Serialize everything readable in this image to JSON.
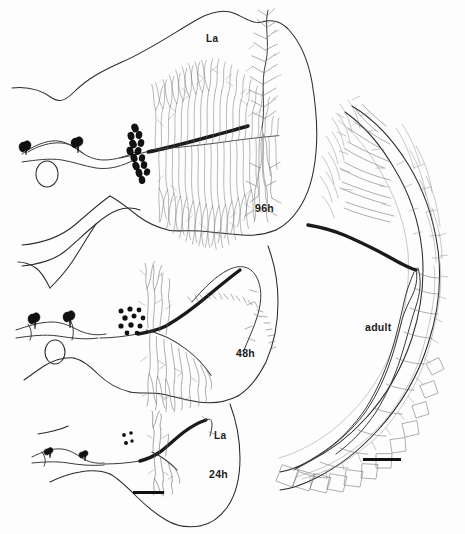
{
  "figure": {
    "background_color": "#fdfdfd",
    "ink_color": "#2b2b2b",
    "dark_ink_color": "#111111",
    "width": 465,
    "height": 534
  },
  "panels": [
    {
      "id": "panel-96h",
      "stage_label": "96h",
      "region_label": "La",
      "stage_label_pos": {
        "x": 255,
        "y": 202
      },
      "region_label_pos": {
        "x": 206,
        "y": 38
      },
      "description": "Dense terminal arborization with numerous dark boutons along proximal axon and two teardrop somata",
      "bouton_count": 14,
      "soma_count": 2
    },
    {
      "id": "panel-48h",
      "stage_label": "48h",
      "region_label": "",
      "stage_label_pos": {
        "x": 236,
        "y": 347
      },
      "description": "Intermediate arborization with a cluster of dark boutons and an extended spiny axon branch",
      "bouton_count": 11,
      "soma_count": 2
    },
    {
      "id": "panel-24h",
      "stage_label": "24h",
      "region_label": "La",
      "stage_label_pos": {
        "x": 209,
        "y": 469
      },
      "region_label_pos": {
        "x": 214,
        "y": 435
      },
      "description": "Sparse early arborization with few small boutons and two small somata",
      "bouton_count": 4,
      "soma_count": 2
    },
    {
      "id": "panel-adult",
      "stage_label": "adult",
      "region_label": "",
      "stage_label_pos": {
        "x": 365,
        "y": 322
      },
      "description": "Mature arborization following the curved lamina with thick stained axon entering from the left",
      "bouton_count": 0,
      "soma_count": 0
    }
  ],
  "scale_bars": [
    {
      "id": "scalebar-larval",
      "x": 133,
      "y": 491,
      "width": 31,
      "height": 3
    },
    {
      "id": "scalebar-adult",
      "x": 363,
      "y": 458,
      "width": 38,
      "height": 3
    }
  ]
}
